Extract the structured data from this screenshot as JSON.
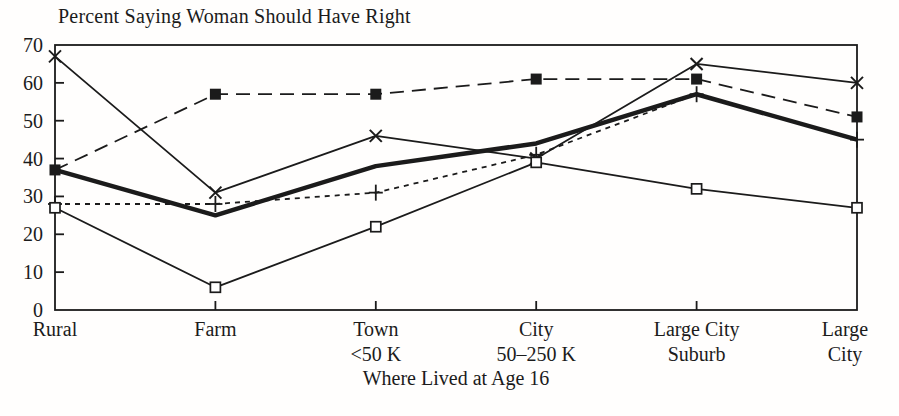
{
  "page": {
    "background": "#fffefd",
    "ink": "#1b1b1b"
  },
  "chart_data": {
    "type": "line",
    "title": "Percent Saying Woman Should Have Right",
    "xlabel": "Where Lived at Age 16",
    "ylabel": "",
    "ylim": [
      0,
      70
    ],
    "ytick_interval": 10,
    "ytick_labels": [
      "0",
      "10",
      "20",
      "30",
      "40",
      "50",
      "60",
      "70"
    ],
    "grid": false,
    "legend": "none",
    "categories": [
      "Rural",
      "Farm",
      "Town <50 K",
      "City 50–250 K",
      "Large City Suburb",
      "Large City"
    ],
    "category_label_lines": [
      [
        "Rural"
      ],
      [
        "Farm"
      ],
      [
        "Town",
        "<50 K"
      ],
      [
        "City",
        "50–250 K"
      ],
      [
        "Large City",
        "Suburb"
      ],
      [
        "Large",
        "City"
      ]
    ],
    "series": [
      {
        "name": "series-x-solid",
        "marker": "x",
        "line": "solid",
        "thickness": "thin",
        "values": [
          67,
          31,
          46,
          40,
          65,
          60
        ]
      },
      {
        "name": "series-filled-square-long-dash",
        "marker": "filled-square",
        "line": "long-dash",
        "thickness": "thin",
        "values": [
          37,
          57,
          57,
          61,
          61,
          51
        ]
      },
      {
        "name": "series-thick-solid",
        "marker": "none",
        "line": "solid",
        "thickness": "thick",
        "values": [
          37,
          25,
          38,
          44,
          57,
          45
        ]
      },
      {
        "name": "series-plus-short-dash",
        "marker": "plus",
        "line": "short-dash",
        "thickness": "thin",
        "values": [
          28,
          28,
          31,
          41,
          57,
          45
        ]
      },
      {
        "name": "series-open-square-solid",
        "marker": "open-square",
        "line": "solid",
        "thickness": "thin",
        "values": [
          27,
          6,
          22,
          39,
          32,
          27
        ]
      }
    ]
  }
}
